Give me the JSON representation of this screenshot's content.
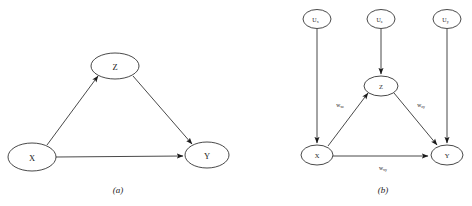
{
  "figure": {
    "background_color": "#ffffff",
    "stroke_color": "#1a1a1a",
    "panels": [
      {
        "id": "panel-a",
        "caption": "(a)",
        "nodes": [
          {
            "id": "a-x",
            "label": "X",
            "sub": "",
            "cx": 32,
            "cy": 157,
            "rx": 24,
            "ry": 14
          },
          {
            "id": "a-z",
            "label": "Z",
            "sub": "",
            "cx": 115,
            "cy": 66,
            "rx": 24,
            "ry": 13
          },
          {
            "id": "a-y",
            "label": "Y",
            "sub": "",
            "cx": 207,
            "cy": 155,
            "rx": 22,
            "ry": 13
          }
        ],
        "edges": [
          {
            "id": "a-edge-xz",
            "from": "X",
            "to": "Z",
            "label": ""
          },
          {
            "id": "a-edge-zy",
            "from": "Z",
            "to": "Y",
            "label": ""
          },
          {
            "id": "a-edge-xy",
            "from": "X",
            "to": "Y",
            "label": ""
          }
        ]
      },
      {
        "id": "panel-b",
        "caption": "(b)",
        "nodes": [
          {
            "id": "b-ux",
            "label": "U",
            "sub": "x",
            "cx": 317,
            "cy": 19,
            "rx": 14,
            "ry": 9.5
          },
          {
            "id": "b-uz",
            "label": "U",
            "sub": "z",
            "cx": 381,
            "cy": 19,
            "rx": 14,
            "ry": 9.5
          },
          {
            "id": "b-uy",
            "label": "U",
            "sub": "y",
            "cx": 447,
            "cy": 19,
            "rx": 14,
            "ry": 9.5
          },
          {
            "id": "b-x",
            "label": "X",
            "sub": "",
            "cx": 317,
            "cy": 155,
            "rx": 16,
            "ry": 10
          },
          {
            "id": "b-z",
            "label": "Z",
            "sub": "",
            "cx": 381,
            "cy": 86,
            "rx": 17,
            "ry": 10
          },
          {
            "id": "b-y",
            "label": "Y",
            "sub": "",
            "cx": 447,
            "cy": 155,
            "rx": 16,
            "ry": 10
          }
        ],
        "edges": [
          {
            "id": "b-edge-uxx",
            "from": "U_x",
            "to": "X",
            "label": ""
          },
          {
            "id": "b-edge-uzz",
            "from": "U_z",
            "to": "Z",
            "label": ""
          },
          {
            "id": "b-edge-uyy",
            "from": "U_y",
            "to": "Y",
            "label": ""
          },
          {
            "id": "b-edge-xz",
            "from": "X",
            "to": "Z",
            "label": "w",
            "label_sub": "xz",
            "label_x": 340,
            "label_y": 105
          },
          {
            "id": "b-edge-zy",
            "from": "Z",
            "to": "Y",
            "label": "w",
            "label_sub": "zy",
            "label_x": 421,
            "label_y": 105
          },
          {
            "id": "b-edge-xy",
            "from": "X",
            "to": "Y",
            "label": "w",
            "label_sub": "xy",
            "label_x": 383,
            "label_y": 168
          }
        ]
      }
    ]
  }
}
